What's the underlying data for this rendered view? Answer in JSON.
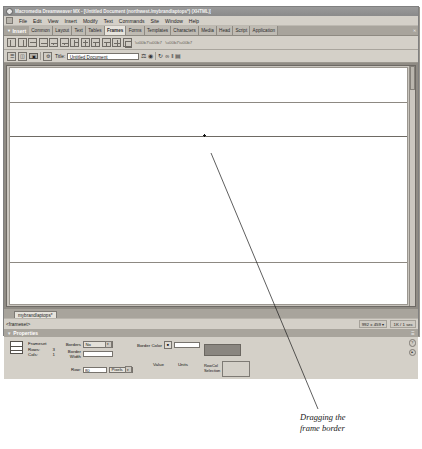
{
  "window": {
    "title": "Macromedia Dreamweaver MX - [Untitled Document (northwest./mybrandlaptops*) (XHTML)]",
    "app_icon": "dreamweaver-icon",
    "minimize": "_",
    "maximize": "□",
    "close": "✕"
  },
  "menubar": {
    "system_icon": "system-menu-icon",
    "items": [
      "File",
      "Edit",
      "View",
      "Insert",
      "Modify",
      "Text",
      "Commands",
      "Site",
      "Window",
      "Help"
    ]
  },
  "insert_panel": {
    "title": "Insert",
    "expander": "▼",
    "close": "✕",
    "tabs": [
      {
        "label": "Common",
        "active": false
      },
      {
        "label": "Layout",
        "active": false
      },
      {
        "label": "Text",
        "active": false
      },
      {
        "label": "Tables",
        "active": false
      },
      {
        "label": "Frames",
        "active": true
      },
      {
        "label": "Forms",
        "active": false
      },
      {
        "label": "Templates",
        "active": false
      },
      {
        "label": "Characters",
        "active": false
      },
      {
        "label": "Media",
        "active": false
      },
      {
        "label": "Head",
        "active": false
      },
      {
        "label": "Script",
        "active": false
      },
      {
        "label": "Application",
        "active": false
      }
    ]
  },
  "frame_toolbar": {
    "buttons": [
      "frame-left-icon",
      "frame-right-icon",
      "frame-top-icon",
      "frame-bottom-icon",
      "frame-bottom-nested-left-icon",
      "frame-bottom-nested-right-icon",
      "frame-left-nested-top-icon",
      "frame-right-nested-top-icon",
      "frame-top-nested-left-icon",
      "frame-top-nested-right-icon",
      "frame-split-icon",
      "frame-all-icon"
    ],
    "extra_icons": [
      "toolbar-overflow-icon",
      "toolbar-help-icon"
    ]
  },
  "doc_toolbar": {
    "view_code_icon": "code-view-icon",
    "view_split_icon": "split-view-icon",
    "view_design_icon": "design-view-icon",
    "live_data_icon": "live-data-icon",
    "title_label": "Title:",
    "title_value": "Untitled Document",
    "title_placeholder": "Untitled Document",
    "file_management_icon": "file-management-icon",
    "preview_icon": "preview-in-browser-icon",
    "refresh_icon": "refresh-design-view-icon",
    "reference_icon": "reference-icon",
    "code_nav_icon": "code-navigation-icon",
    "options_icon": "view-options-icon"
  },
  "document": {
    "frames": [
      "frame-top",
      "frame-middle",
      "frame-bottom"
    ],
    "drag_handle": "frame-border-drag-handle",
    "scrollbar": "vertical-scrollbar"
  },
  "doc_tab": {
    "label": "mybrandlaptops*"
  },
  "statusbar": {
    "tag_selector": "<frameset>",
    "window_size": "992 x 459",
    "size_chevron": "▾",
    "download_size": "1K / 1 sec"
  },
  "properties": {
    "title": "Properties",
    "expander": "▼",
    "help_icon": "?",
    "collapse_icon": "▴",
    "object_icon": "frameset-preview-icon",
    "object_type": "Frameset",
    "rows_label": "Rows:",
    "rows_value": "3",
    "cols_label": "Cols:",
    "cols_value": "1",
    "borders_label": "Borders",
    "borders_value": "No",
    "border_width_label": "Border Width",
    "border_width_value": "",
    "border_color_label": "Border Color",
    "border_color_swatch": "color-picker-icon",
    "border_color_value": "",
    "value_header": "Value",
    "units_header": "Units",
    "row_label": "Row:",
    "row_value": "80",
    "units_value": "Pixels",
    "rowcol_label_line1": "RowCol",
    "rowcol_label_line2": "Selection"
  },
  "annotation": {
    "line1": "Dragging the",
    "line2": "frame border"
  },
  "colors": {
    "panel_bg": "#d4d0c8",
    "panel_header": "#a8a49c",
    "titlebar": "#8f8f8f",
    "canvas_bg": "#8f8b84",
    "page_white": "#ffffff"
  }
}
